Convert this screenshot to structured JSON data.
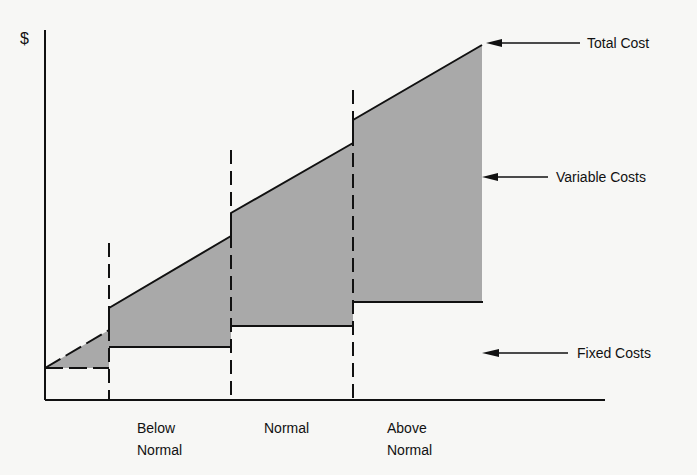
{
  "diagram": {
    "y_axis_label": "$",
    "callouts": {
      "total_cost": "Total Cost",
      "variable_costs": "Variable Costs",
      "fixed_costs": "Fixed Costs"
    },
    "regions": [
      {
        "line1": "Below",
        "line2": "Normal"
      },
      {
        "line1": "Normal",
        "line2": ""
      },
      {
        "line1": "Above",
        "line2": "Normal"
      }
    ],
    "colors": {
      "fill": "#a9a9a9",
      "line": "#111111",
      "background": "#f7f7f5"
    }
  }
}
